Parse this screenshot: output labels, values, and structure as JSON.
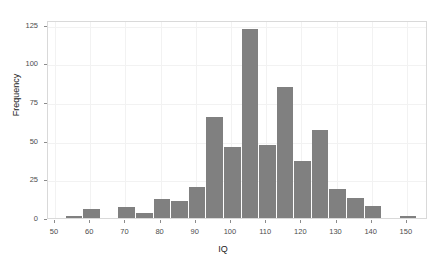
{
  "chart_data": {
    "type": "bar",
    "title": "",
    "subtitle": "",
    "xlabel": "IQ",
    "ylabel": "Frequency",
    "xlim": [
      48,
      156
    ],
    "ylim": [
      0,
      128
    ],
    "grid": true,
    "legend": null,
    "bar_color": "#808080",
    "plot_background": "#ffffff",
    "border_color": "#d9d9d9",
    "bin_width": 5,
    "xticks": [
      50,
      60,
      70,
      80,
      90,
      100,
      110,
      120,
      130,
      140,
      150
    ],
    "xtick_labels": [
      "50",
      "60",
      "70",
      "80",
      "90",
      "100",
      "110",
      "120",
      "130",
      "140",
      "150"
    ],
    "yticks": [
      0,
      25,
      50,
      75,
      100,
      125
    ],
    "ytick_labels": [
      "0",
      "25",
      "50",
      "75",
      "100",
      "125"
    ],
    "bins": [
      {
        "start": 53,
        "end": 58,
        "center": 55.5,
        "value": 1
      },
      {
        "start": 58,
        "end": 63,
        "center": 60.5,
        "value": 6
      },
      {
        "start": 63,
        "end": 68,
        "center": 65.5,
        "value": 0
      },
      {
        "start": 68,
        "end": 73,
        "center": 70.5,
        "value": 7
      },
      {
        "start": 73,
        "end": 78,
        "center": 75.5,
        "value": 3
      },
      {
        "start": 78,
        "end": 83,
        "center": 80.5,
        "value": 12
      },
      {
        "start": 83,
        "end": 88,
        "center": 85.5,
        "value": 11
      },
      {
        "start": 88,
        "end": 93,
        "center": 90.5,
        "value": 20
      },
      {
        "start": 93,
        "end": 98,
        "center": 95.5,
        "value": 65
      },
      {
        "start": 98,
        "end": 103,
        "center": 100.5,
        "value": 46
      },
      {
        "start": 103,
        "end": 108,
        "center": 105.5,
        "value": 122
      },
      {
        "start": 108,
        "end": 113,
        "center": 110.5,
        "value": 47
      },
      {
        "start": 113,
        "end": 118,
        "center": 115.5,
        "value": 85
      },
      {
        "start": 118,
        "end": 123,
        "center": 120.5,
        "value": 37
      },
      {
        "start": 123,
        "end": 128,
        "center": 125.5,
        "value": 57
      },
      {
        "start": 128,
        "end": 133,
        "center": 130.5,
        "value": 19
      },
      {
        "start": 133,
        "end": 138,
        "center": 135.5,
        "value": 13
      },
      {
        "start": 138,
        "end": 143,
        "center": 140.5,
        "value": 8
      },
      {
        "start": 143,
        "end": 148,
        "center": 145.5,
        "value": 0
      },
      {
        "start": 148,
        "end": 153,
        "center": 150.5,
        "value": 1
      }
    ],
    "categories": [
      55.5,
      60.5,
      65.5,
      70.5,
      75.5,
      80.5,
      85.5,
      90.5,
      95.5,
      100.5,
      105.5,
      110.5,
      115.5,
      120.5,
      125.5,
      130.5,
      135.5,
      140.5,
      145.5,
      150.5
    ],
    "values": [
      1,
      6,
      0,
      7,
      3,
      12,
      11,
      20,
      65,
      46,
      122,
      47,
      85,
      37,
      57,
      19,
      13,
      8,
      0,
      1
    ]
  }
}
